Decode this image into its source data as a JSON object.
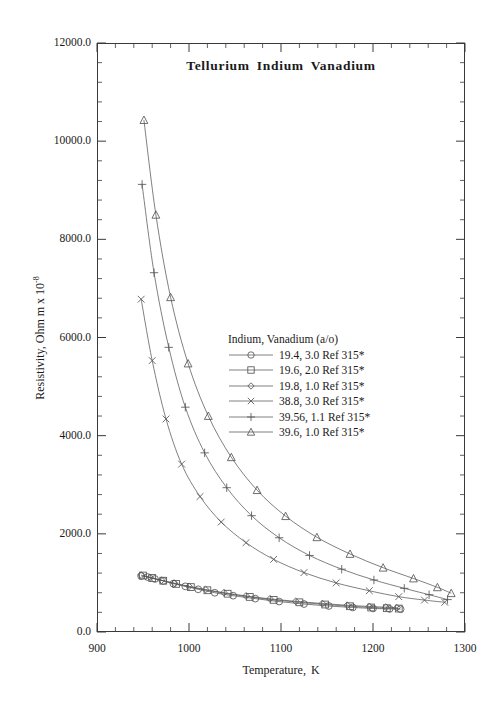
{
  "chart_data": {
    "type": "line",
    "title": "Tellurium  Indium  Vanadium",
    "xlabel": "Temperature,  K",
    "ylabel": "Resistivity, Ohm m x 10",
    "ylabel_exponent": "-8",
    "xlim": [
      900,
      1300
    ],
    "ylim": [
      0.0,
      12000.0
    ],
    "xticks": [
      900,
      1000,
      1100,
      1200,
      1300
    ],
    "xtick_labels": [
      "900",
      "1000",
      "1100",
      "1200",
      "1300"
    ],
    "yticks": [
      0.0,
      2000.0,
      4000.0,
      6000.0,
      8000.0,
      10000.0,
      12000.0
    ],
    "ytick_labels": [
      "0.0",
      "2000.0",
      "4000.0",
      "6000.0",
      "8000.0",
      "10000.0",
      "12000.0"
    ],
    "xminor_step": 20,
    "yminor_step": 400,
    "grid": false,
    "legend_position": "center-right-inside",
    "legend_title": "Indium, Vanadium (a/o)",
    "line_color": "#555555",
    "axis_color": "#3a3a3a",
    "series": [
      {
        "name": "19.4, 3.0 Ref 315*",
        "marker": "circle",
        "x": [
          948,
          955,
          963,
          972,
          983,
          996,
          1010,
          1028,
          1048,
          1072,
          1098,
          1125,
          1152,
          1178,
          1200,
          1218,
          1230
        ],
        "y": [
          1140,
          1120,
          1080,
          1040,
          985,
          930,
          870,
          800,
          740,
          680,
          620,
          570,
          530,
          500,
          480,
          470,
          465
        ]
      },
      {
        "name": "19.6, 2.0 Ref 315*",
        "marker": "square",
        "x": [
          950,
          960,
          972,
          986,
          1002,
          1020,
          1042,
          1066,
          1092,
          1120,
          1148,
          1175,
          1198,
          1215,
          1228
        ],
        "y": [
          1150,
          1100,
          1045,
          980,
          915,
          850,
          780,
          715,
          655,
          605,
          560,
          525,
          500,
          485,
          478
        ]
      },
      {
        "name": "19.8, 1.0 Ref 315*",
        "marker": "diamond",
        "x": [
          948,
          958,
          970,
          984,
          1000,
          1018,
          1038,
          1062,
          1088,
          1116,
          1145,
          1172,
          1196,
          1214,
          1226
        ],
        "y": [
          1160,
          1110,
          1055,
          995,
          930,
          865,
          800,
          735,
          675,
          625,
          580,
          545,
          520,
          505,
          495
        ]
      },
      {
        "name": "38.8, 3.0 Ref 315*",
        "marker": "cross",
        "x": [
          948,
          960,
          975,
          992,
          1012,
          1035,
          1062,
          1092,
          1125,
          1160,
          1196,
          1228,
          1256,
          1278
        ],
        "y": [
          6780,
          5530,
          4340,
          3420,
          2760,
          2240,
          1820,
          1480,
          1210,
          1000,
          840,
          720,
          650,
          605
        ]
      },
      {
        "name": "39.56, 1.1 Ref 315*",
        "marker": "plus",
        "x": [
          949,
          962,
          978,
          996,
          1017,
          1041,
          1068,
          1098,
          1131,
          1166,
          1201,
          1234,
          1261,
          1281
        ],
        "y": [
          9120,
          7320,
          5800,
          4580,
          3650,
          2940,
          2370,
          1920,
          1560,
          1280,
          1060,
          890,
          760,
          660
        ]
      },
      {
        "name": "39.6, 1.0 Ref 315*",
        "marker": "triangle",
        "x": [
          951,
          964,
          980,
          999,
          1021,
          1046,
          1074,
          1105,
          1139,
          1175,
          1211,
          1244,
          1270,
          1285
        ],
        "y": [
          10430,
          8500,
          6820,
          5470,
          4400,
          3560,
          2890,
          2360,
          1930,
          1590,
          1310,
          1090,
          910,
          790
        ]
      }
    ]
  }
}
